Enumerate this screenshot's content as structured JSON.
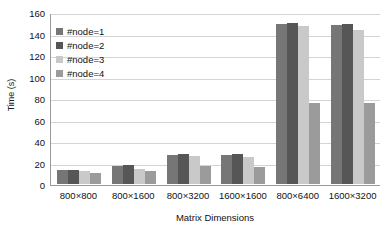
{
  "chart_data": {
    "type": "bar",
    "title": "",
    "xlabel": "Matrix Dimensions",
    "ylabel": "Time (s)",
    "ylim": [
      0,
      160
    ],
    "yticks": [
      0,
      20,
      40,
      60,
      80,
      100,
      120,
      140,
      160
    ],
    "grid": true,
    "legend_position": "top-left",
    "categories": [
      "800×800",
      "800×1600",
      "800×3200",
      "1600×1600",
      "800×6400",
      "1600×3200"
    ],
    "series": [
      {
        "name": "#node=1",
        "color": "#767676",
        "values": [
          13,
          17,
          27,
          27,
          149,
          148
        ]
      },
      {
        "name": "#node=2",
        "color": "#565656",
        "values": [
          13,
          18,
          28,
          28,
          150,
          149
        ]
      },
      {
        "name": "#node=3",
        "color": "#c9c9c9",
        "values": [
          12,
          14,
          26,
          25,
          147,
          143
        ]
      },
      {
        "name": "#node=4",
        "color": "#9b9b9b",
        "values": [
          10,
          12,
          17,
          16,
          75,
          75
        ]
      }
    ]
  },
  "axis": {
    "y_title": "Time (s)",
    "x_title": "Matrix Dimensions"
  },
  "legend": {
    "items": [
      {
        "label": "#node=1",
        "color": "#767676"
      },
      {
        "label": "#node=2",
        "color": "#565656"
      },
      {
        "label": "#node=3",
        "color": "#c9c9c9"
      },
      {
        "label": "#node=4",
        "color": "#9b9b9b"
      }
    ]
  },
  "colors": {
    "gridline": "#d4d4d4",
    "axis": "#9a9a9a",
    "text": "#111111",
    "background": "#ffffff"
  }
}
